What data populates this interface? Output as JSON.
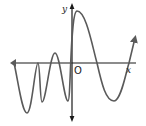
{
  "diagram": {
    "type": "function-graph",
    "axes": {
      "x_label": "x",
      "y_label": "y",
      "origin_label": "O",
      "axis_color": "#1a1a1a"
    },
    "curve": {
      "color": "#5a5a5a",
      "description": "Oscillating curve with increasing period from left to right, rising to a tall maximum just right of the y-axis, then descending to a minimum and rising again with an arrow at the right end",
      "key_points": [
        {
          "label": "left-end-arrow",
          "x": -8.5,
          "y": 0
        },
        {
          "label": "min",
          "x": -6.5,
          "y": -7
        },
        {
          "label": "max-touch",
          "x": -4.8,
          "y": 0
        },
        {
          "label": "min",
          "x": -4.3,
          "y": -5.5
        },
        {
          "label": "max",
          "x": -2.5,
          "y": 1.4
        },
        {
          "label": "min",
          "x": -0.5,
          "y": -5.3
        },
        {
          "label": "max",
          "x": 0.8,
          "y": 7.5
        },
        {
          "label": "x-intercept",
          "x": 3.6,
          "y": 0
        },
        {
          "label": "min",
          "x": 6.0,
          "y": -5.3
        },
        {
          "label": "x-intercept",
          "x": 8.1,
          "y": 0
        },
        {
          "label": "right-end-arrow",
          "x": 9.0,
          "y": 3.6
        }
      ]
    }
  }
}
